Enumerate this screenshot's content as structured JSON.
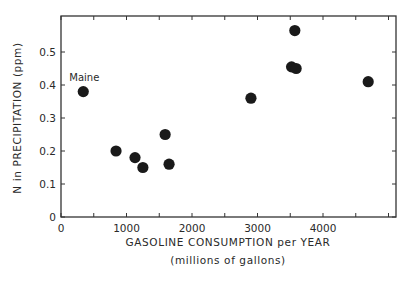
{
  "chart_data": {
    "type": "scatter",
    "title": "",
    "xlabel": "GASOLINE CONSUMPTION per YEAR",
    "xlabel_sub": "(millions of gallons)",
    "ylabel": "N in PRECIPITATION (ppm)",
    "xlim": [
      0,
      5000
    ],
    "ylim": [
      0,
      0.6
    ],
    "x_ticks": [
      0,
      500,
      1000,
      1500,
      2000,
      2500,
      3000,
      3500,
      4000,
      4500,
      5000
    ],
    "x_tick_labels": [
      "0",
      "1000",
      "2000",
      "3000",
      "4000"
    ],
    "x_tick_label_values": [
      0,
      1000,
      2000,
      3000,
      4000
    ],
    "y_ticks": [
      0,
      0.1,
      0.2,
      0.3,
      0.4,
      0.5
    ],
    "y_tick_labels": [
      "0",
      "0.1",
      "0.2",
      "0.3",
      "0.4",
      "0.5"
    ],
    "grid": false,
    "legend": null,
    "series": [
      {
        "name": "States",
        "color": "#1a1a1a",
        "points": [
          {
            "x": 340,
            "y": 0.38,
            "label": "Maine"
          },
          {
            "x": 840,
            "y": 0.2
          },
          {
            "x": 1130,
            "y": 0.18
          },
          {
            "x": 1250,
            "y": 0.15
          },
          {
            "x": 1590,
            "y": 0.25
          },
          {
            "x": 1650,
            "y": 0.16
          },
          {
            "x": 2900,
            "y": 0.36
          },
          {
            "x": 3520,
            "y": 0.455
          },
          {
            "x": 3590,
            "y": 0.45
          },
          {
            "x": 3570,
            "y": 0.565
          },
          {
            "x": 4690,
            "y": 0.41
          }
        ]
      }
    ],
    "annotations": [
      {
        "text": "Maine",
        "x": 340,
        "y": 0.38
      }
    ]
  },
  "style": {
    "axis_color": "#333333",
    "point_color": "#1a1a1a",
    "background": "#ffffff"
  }
}
